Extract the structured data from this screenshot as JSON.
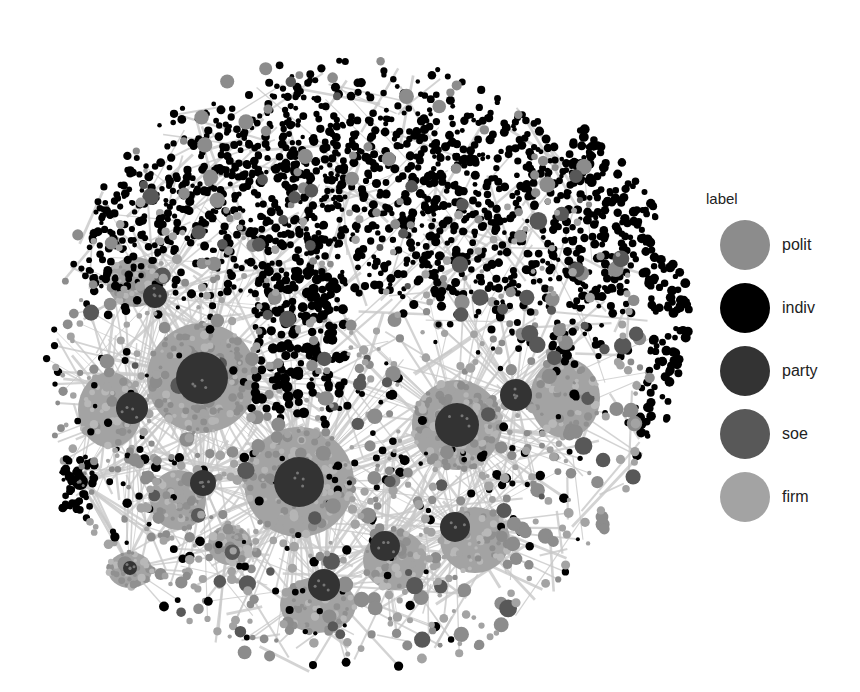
{
  "figure": {
    "type": "network-graph"
  },
  "legend": {
    "title": "label",
    "items": [
      {
        "key": "polit",
        "label": "polit",
        "color": "#8c8c8c"
      },
      {
        "key": "indiv",
        "label": "indiv",
        "color": "#000000"
      },
      {
        "key": "party",
        "label": "party",
        "color": "#333333"
      },
      {
        "key": "soe",
        "label": "soe",
        "color": "#585858"
      },
      {
        "key": "firm",
        "label": "firm",
        "color": "#a3a3a3"
      }
    ]
  },
  "graph": {
    "edge_color": "#c8c8c8",
    "cloud": {
      "cx": 360,
      "cy": 230,
      "rx": 280,
      "ry": 180,
      "top": 55
    },
    "hubs": [
      {
        "x": 202,
        "y": 378,
        "r": 26,
        "cluster_r": 55,
        "type": "party",
        "cluster": "firm"
      },
      {
        "x": 299,
        "y": 482,
        "r": 25,
        "cluster_r": 55,
        "type": "party",
        "cluster": "firm"
      },
      {
        "x": 457,
        "y": 425,
        "r": 22,
        "cluster_r": 45,
        "type": "party",
        "cluster": "firm"
      },
      {
        "x": 516,
        "y": 395,
        "r": 16,
        "cluster_r": 0,
        "type": "party",
        "cluster": "firm"
      },
      {
        "x": 132,
        "y": 408,
        "r": 16,
        "cluster_r": 0,
        "type": "party",
        "cluster": "firm"
      },
      {
        "x": 324,
        "y": 585,
        "r": 16,
        "cluster_r": 0,
        "type": "party",
        "cluster": "firm"
      },
      {
        "x": 385,
        "y": 546,
        "r": 15,
        "cluster_r": 0,
        "type": "party",
        "cluster": "firm"
      },
      {
        "x": 455,
        "y": 527,
        "r": 15,
        "cluster_r": 0,
        "type": "party",
        "cluster": "firm"
      },
      {
        "x": 203,
        "y": 483,
        "r": 13,
        "cluster_r": 0,
        "type": "party",
        "cluster": "firm"
      },
      {
        "x": 155,
        "y": 296,
        "r": 12,
        "cluster_r": 0,
        "type": "party",
        "cluster": "firm"
      },
      {
        "x": 130,
        "y": 568,
        "r": 7,
        "cluster_r": 0,
        "type": "party",
        "cluster": "firm"
      },
      {
        "x": 80,
        "y": 482,
        "r": 8,
        "cluster_r": 0,
        "type": "indiv",
        "cluster": "indiv"
      }
    ],
    "blobs": [
      {
        "x": 110,
        "y": 410,
        "rx": 32,
        "ry": 38,
        "type": "firm"
      },
      {
        "x": 565,
        "y": 398,
        "rx": 35,
        "ry": 40,
        "type": "firm"
      },
      {
        "x": 318,
        "y": 605,
        "rx": 38,
        "ry": 28,
        "type": "firm"
      },
      {
        "x": 395,
        "y": 560,
        "rx": 32,
        "ry": 30,
        "type": "firm"
      },
      {
        "x": 475,
        "y": 540,
        "rx": 35,
        "ry": 33,
        "type": "firm"
      },
      {
        "x": 178,
        "y": 500,
        "rx": 28,
        "ry": 30,
        "type": "firm"
      },
      {
        "x": 135,
        "y": 282,
        "rx": 28,
        "ry": 25,
        "type": "firm"
      },
      {
        "x": 130,
        "y": 570,
        "rx": 22,
        "ry": 18,
        "type": "firm"
      },
      {
        "x": 230,
        "y": 545,
        "rx": 22,
        "ry": 20,
        "type": "firm"
      }
    ],
    "node_counts": {
      "indiv": 1400,
      "polit": 260,
      "soe": 90,
      "firm_scatter": 300
    },
    "seed": 42
  }
}
